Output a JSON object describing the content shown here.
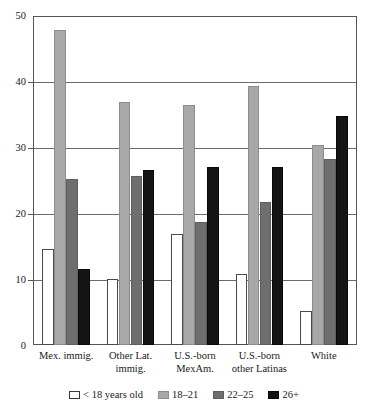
{
  "chart_data": {
    "type": "bar",
    "title": "",
    "subtitle": "",
    "xlabel": "",
    "ylabel": "",
    "ylim": [
      0,
      50
    ],
    "yticks": [
      0,
      10,
      20,
      30,
      40,
      50
    ],
    "ytick_labels": [
      "0",
      "10",
      "20",
      "30",
      "40",
      "50"
    ],
    "grid": true,
    "legend_position": "bottom",
    "categories": [
      "Mex. immig.",
      "Other Lat.\nimmig.",
      "U.S.-born\nMexAm.",
      "U.S.-born\nother Latinas",
      "White"
    ],
    "series": [
      {
        "name": "< 18 years old",
        "color": "#ffffff",
        "values": [
          14.6,
          10.0,
          16.9,
          10.8,
          5.2
        ]
      },
      {
        "name": "18–21",
        "color": "#a8a8a8",
        "values": [
          48.0,
          37.0,
          36.6,
          39.5,
          30.5
        ]
      },
      {
        "name": "22–25",
        "color": "#6e6e6e",
        "values": [
          25.3,
          25.7,
          18.8,
          21.8,
          28.3
        ]
      },
      {
        "name": "26+",
        "color": "#141414",
        "values": [
          11.6,
          26.7,
          27.2,
          27.2,
          34.9
        ]
      }
    ]
  },
  "legend": {
    "items": [
      {
        "label": "< 18 years old",
        "swatch": "legend-swatch-under-18"
      },
      {
        "label": "18–21",
        "swatch": "legend-swatch-18-21"
      },
      {
        "label": "22–25",
        "swatch": "legend-swatch-22-25"
      },
      {
        "label": "26+",
        "swatch": "legend-swatch-26-plus"
      }
    ]
  },
  "axis": {
    "y_tick_labels": [
      "50",
      "40",
      "30",
      "20",
      "10",
      "0"
    ]
  },
  "colors": {
    "axis": "#555555",
    "grid": "#6b6b6b",
    "text": "#1a1a1a",
    "background": "#ffffff"
  }
}
